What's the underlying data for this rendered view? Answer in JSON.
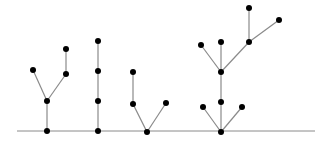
{
  "diagram": {
    "title": "",
    "colors": {
      "edge": "#8a8a8a",
      "node": "#000000",
      "baseline": "#8a8a8a"
    },
    "baseline": {
      "x1": 17,
      "y": 131,
      "x2": 315
    },
    "node_radius": 3,
    "trees": [
      {
        "name": "tree-1",
        "nodes": [
          {
            "id": "r",
            "x": 47,
            "y": 131
          },
          {
            "id": "a",
            "x": 47,
            "y": 101
          },
          {
            "id": "b",
            "x": 33,
            "y": 70
          },
          {
            "id": "c",
            "x": 66,
            "y": 74
          },
          {
            "id": "d",
            "x": 66,
            "y": 49
          }
        ],
        "edges": [
          [
            "r",
            "a"
          ],
          [
            "a",
            "b"
          ],
          [
            "a",
            "c"
          ],
          [
            "c",
            "d"
          ]
        ]
      },
      {
        "name": "tree-2",
        "nodes": [
          {
            "id": "r",
            "x": 98,
            "y": 131
          },
          {
            "id": "a",
            "x": 98,
            "y": 101
          },
          {
            "id": "b",
            "x": 98,
            "y": 71
          },
          {
            "id": "c",
            "x": 98,
            "y": 41
          }
        ],
        "edges": [
          [
            "r",
            "a"
          ],
          [
            "a",
            "b"
          ],
          [
            "b",
            "c"
          ]
        ]
      },
      {
        "name": "tree-3",
        "nodes": [
          {
            "id": "r",
            "x": 147,
            "y": 132
          },
          {
            "id": "a",
            "x": 133,
            "y": 104
          },
          {
            "id": "b",
            "x": 133,
            "y": 72
          },
          {
            "id": "c",
            "x": 166,
            "y": 103
          }
        ],
        "edges": [
          [
            "r",
            "a"
          ],
          [
            "a",
            "b"
          ],
          [
            "r",
            "c"
          ]
        ]
      },
      {
        "name": "tree-4",
        "nodes": [
          {
            "id": "r",
            "x": 221,
            "y": 132
          },
          {
            "id": "a",
            "x": 203,
            "y": 107
          },
          {
            "id": "b",
            "x": 221,
            "y": 102
          },
          {
            "id": "c",
            "x": 242,
            "y": 107
          },
          {
            "id": "d",
            "x": 221,
            "y": 72
          },
          {
            "id": "e",
            "x": 201,
            "y": 45
          },
          {
            "id": "f",
            "x": 221,
            "y": 42
          },
          {
            "id": "g",
            "x": 249,
            "y": 42
          },
          {
            "id": "h",
            "x": 249,
            "y": 8
          },
          {
            "id": "i",
            "x": 279,
            "y": 20
          }
        ],
        "edges": [
          [
            "r",
            "a"
          ],
          [
            "r",
            "b"
          ],
          [
            "r",
            "c"
          ],
          [
            "b",
            "d"
          ],
          [
            "d",
            "e"
          ],
          [
            "d",
            "f"
          ],
          [
            "d",
            "g"
          ],
          [
            "g",
            "h"
          ],
          [
            "g",
            "i"
          ]
        ]
      }
    ]
  }
}
